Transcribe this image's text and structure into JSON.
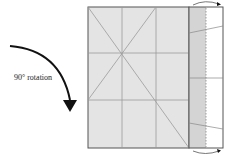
{
  "diagram": {
    "type": "origami-fold-step",
    "annotation": "90° rotation",
    "colors": {
      "paper": "#e4e4e4",
      "flap_shade": "#d4d4d4",
      "flap_white": "#ffffff",
      "crease": "#9a9a9a",
      "outline": "#555555",
      "arrow": "#111111"
    },
    "elements": [
      "rotation-arrow",
      "square-paper-with-creases",
      "folded-flap-right-edge",
      "fold-arrow-top",
      "fold-arrow-bottom"
    ]
  }
}
